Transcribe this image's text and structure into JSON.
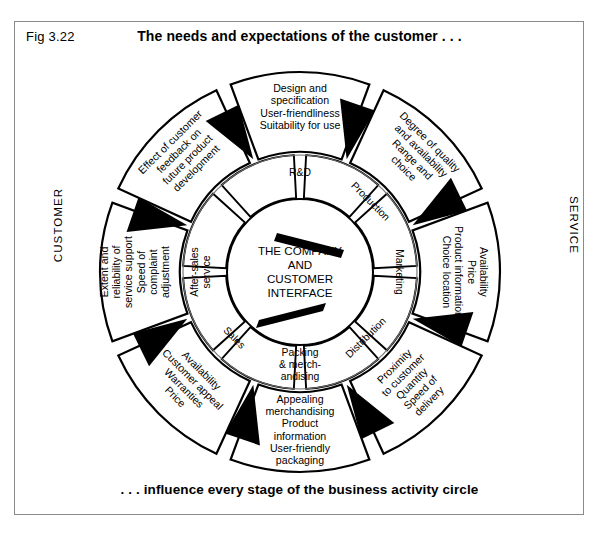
{
  "figure": {
    "label": "Fig 3.22",
    "title": "The needs and expectations of the customer . . .",
    "caption": ". . . influence every stage of the business activity circle",
    "side_label_left": "CUSTOMER",
    "side_label_right": "SERVICE"
  },
  "center": {
    "lines": [
      "THE COMPANY",
      "AND",
      "CUSTOMER",
      "INTERFACE"
    ]
  },
  "inner_ring": [
    {
      "id": "rd",
      "label": [
        "R&D"
      ]
    },
    {
      "id": "production",
      "label": [
        "Production"
      ]
    },
    {
      "id": "marketing",
      "label": [
        "Marketing"
      ]
    },
    {
      "id": "distribution",
      "label": [
        "Distribution"
      ]
    },
    {
      "id": "packing",
      "label": [
        "Packing",
        "& merch-",
        "andising"
      ]
    },
    {
      "id": "sales",
      "label": [
        "Sales"
      ]
    },
    {
      "id": "after-sales-service",
      "label": [
        "After-sales",
        "service"
      ]
    }
  ],
  "outer_ring": [
    {
      "id": "design",
      "lines": [
        "Design and",
        "specification",
        "User-friendliness",
        "Suitability for use"
      ]
    },
    {
      "id": "quality",
      "lines": [
        "Degree of quality",
        "and availability",
        "Range and",
        "choice"
      ]
    },
    {
      "id": "availability",
      "lines": [
        "Availability",
        "Price",
        "Product information",
        "Choice location"
      ]
    },
    {
      "id": "proximity",
      "lines": [
        "Proximity",
        "to customer",
        "Quantity",
        "Speed of",
        "delivery"
      ]
    },
    {
      "id": "merchandising",
      "lines": [
        "Appealing",
        "merchandising",
        "Product",
        "information",
        "User-friendly",
        "packaging"
      ]
    },
    {
      "id": "customer-appeal",
      "lines": [
        "Availability",
        "Customer appeal",
        "Warranties",
        "Price"
      ]
    },
    {
      "id": "service-support",
      "lines": [
        "Extent and",
        "reliability of",
        "service support",
        "Speed of",
        "complaint",
        "adjustment"
      ]
    },
    {
      "id": "feedback",
      "lines": [
        "Effect of customer",
        "feedback on",
        "future product",
        "development"
      ]
    }
  ],
  "chart_data": {
    "type": "diagram",
    "shape": "concentric-wheel",
    "segments": 8,
    "title": "The needs and expectations of the customer . . .",
    "colors": {
      "line": "#000000",
      "wedge": "#000000",
      "background": "#ffffff",
      "frame": "#8a8a8a"
    }
  }
}
